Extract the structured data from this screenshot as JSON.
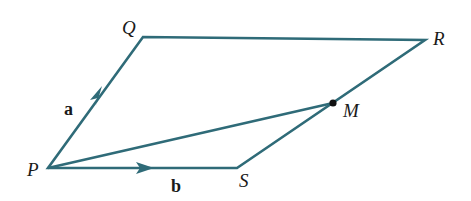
{
  "diagram": {
    "type": "parallelogram-vector",
    "stroke_color": "#2f6b78",
    "points": {
      "P": {
        "label": "P",
        "x": 48,
        "y": 168
      },
      "Q": {
        "label": "Q",
        "x": 143,
        "y": 37
      },
      "R": {
        "label": "R",
        "x": 425,
        "y": 40
      },
      "S": {
        "label": "S",
        "x": 237,
        "y": 168
      },
      "M": {
        "label": "M",
        "x": 333,
        "y": 103
      }
    },
    "vectors": {
      "a": {
        "label": "a",
        "from": "P",
        "to": "Q"
      },
      "b": {
        "label": "b",
        "from": "P",
        "to": "S"
      }
    },
    "segments": [
      "PQ",
      "QR",
      "RS",
      "SP",
      "PM"
    ],
    "midpoint_note": "M lies on SR"
  }
}
